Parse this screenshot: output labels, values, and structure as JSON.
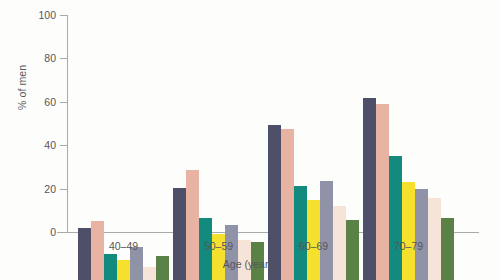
{
  "chart_data": {
    "type": "bar",
    "title": "",
    "xlabel": "Age (years)",
    "ylabel": "% of men",
    "categories": [
      "40–49",
      "50–59",
      "60–69",
      "70–79"
    ],
    "ylim": [
      0,
      100
    ],
    "yticks": [
      0,
      20,
      40,
      60,
      80,
      100
    ],
    "grid": false,
    "legend": "none",
    "series": [
      {
        "name": "series-1",
        "color": "#4e4f68",
        "values": [
          24,
          42.5,
          71.5,
          84
        ]
      },
      {
        "name": "series-2",
        "color": "#e8b3a2",
        "values": [
          27,
          50.5,
          69.5,
          81
        ]
      },
      {
        "name": "series-3",
        "color": "#128b7e",
        "values": [
          12,
          28.5,
          43.5,
          57
        ]
      },
      {
        "name": "series-4",
        "color": "#f5e02e",
        "values": [
          9,
          21,
          37,
          45
        ]
      },
      {
        "name": "series-5",
        "color": "#9093a8",
        "values": [
          15,
          25.5,
          45.5,
          42
        ]
      },
      {
        "name": "series-6",
        "color": "#f7e4d8",
        "values": [
          6,
          18.5,
          34,
          38
        ]
      },
      {
        "name": "series-7",
        "color": "#5b8246",
        "values": [
          11,
          17.5,
          27.5,
          28.5
        ]
      }
    ]
  }
}
